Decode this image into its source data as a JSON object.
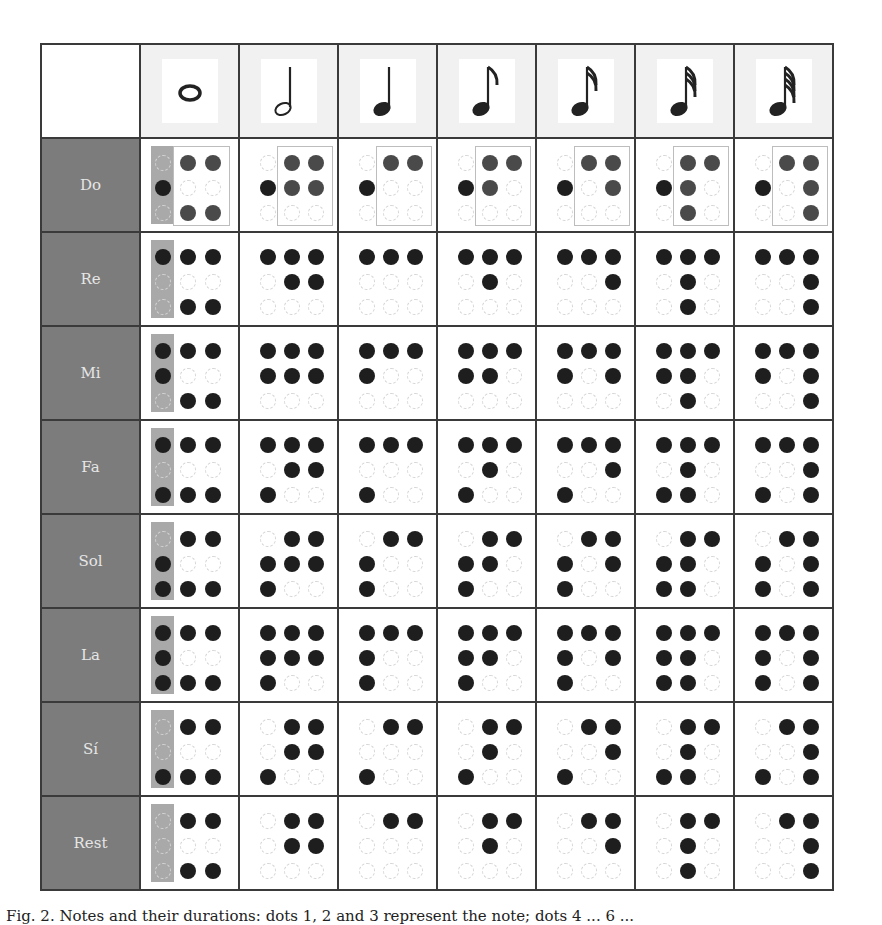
{
  "figure": {
    "caption": "Fig. 2.  Notes and their durations: dots 1, 2 and 3 represent the note; dots 4 ... 6 ...",
    "colors": {
      "row_label_bg": "#7c7c7c",
      "row_label_text": "#e6e6e6",
      "header_bg": "#f1f1f1",
      "grid_line": "#3a3a3a",
      "dot_filled": "#1e1e1e",
      "dot_empty": "#d4d4d4",
      "highlight_bar": "#a9a9a9"
    },
    "columns": [
      {
        "duration": "whole",
        "icon": "whole-note-icon",
        "glyph": "𝅝"
      },
      {
        "duration": "half",
        "icon": "half-note-icon",
        "glyph": "𝅗𝅥"
      },
      {
        "duration": "quarter",
        "icon": "quarter-note-icon",
        "glyph": "♩"
      },
      {
        "duration": "eighth",
        "icon": "eighth-note-icon",
        "glyph": "♪"
      },
      {
        "duration": "sixteenth",
        "icon": "sixteenth-note-icon",
        "glyph": "𝅘𝅥𝅯"
      },
      {
        "duration": "thirty-second",
        "icon": "thirty-second-note-icon",
        "glyph": "𝅘𝅥𝅰"
      },
      {
        "duration": "sixty-fourth",
        "icon": "sixty-fourth-note-icon",
        "glyph": "𝅘𝅥𝅱"
      }
    ],
    "rows": [
      {
        "label": "Do",
        "cells": [
          [
            [
              0,
              1,
              1
            ],
            [
              1,
              0,
              0
            ],
            [
              0,
              1,
              1
            ]
          ],
          [
            [
              0,
              1,
              1
            ],
            [
              1,
              1,
              1
            ],
            [
              0,
              0,
              0
            ]
          ],
          [
            [
              0,
              1,
              1
            ],
            [
              1,
              0,
              0
            ],
            [
              0,
              0,
              0
            ]
          ],
          [
            [
              0,
              1,
              1
            ],
            [
              1,
              1,
              0
            ],
            [
              0,
              0,
              0
            ]
          ],
          [
            [
              0,
              1,
              1
            ],
            [
              1,
              0,
              1
            ],
            [
              0,
              0,
              0
            ]
          ],
          [
            [
              0,
              1,
              1
            ],
            [
              1,
              1,
              0
            ],
            [
              0,
              1,
              0
            ]
          ],
          [
            [
              0,
              1,
              1
            ],
            [
              1,
              0,
              1
            ],
            [
              0,
              0,
              1
            ]
          ]
        ]
      },
      {
        "label": "Re",
        "cells": [
          [
            [
              1,
              1,
              1
            ],
            [
              0,
              0,
              0
            ],
            [
              0,
              1,
              1
            ]
          ],
          [
            [
              1,
              1,
              1
            ],
            [
              0,
              1,
              1
            ],
            [
              0,
              0,
              0
            ]
          ],
          [
            [
              1,
              1,
              1
            ],
            [
              0,
              0,
              0
            ],
            [
              0,
              0,
              0
            ]
          ],
          [
            [
              1,
              1,
              1
            ],
            [
              0,
              1,
              0
            ],
            [
              0,
              0,
              0
            ]
          ],
          [
            [
              1,
              1,
              1
            ],
            [
              0,
              0,
              1
            ],
            [
              0,
              0,
              0
            ]
          ],
          [
            [
              1,
              1,
              1
            ],
            [
              0,
              1,
              0
            ],
            [
              0,
              1,
              0
            ]
          ],
          [
            [
              1,
              1,
              1
            ],
            [
              0,
              0,
              1
            ],
            [
              0,
              0,
              1
            ]
          ]
        ]
      },
      {
        "label": "Mi",
        "cells": [
          [
            [
              1,
              1,
              1
            ],
            [
              1,
              0,
              0
            ],
            [
              0,
              1,
              1
            ]
          ],
          [
            [
              1,
              1,
              1
            ],
            [
              1,
              1,
              1
            ],
            [
              0,
              0,
              0
            ]
          ],
          [
            [
              1,
              1,
              1
            ],
            [
              1,
              0,
              0
            ],
            [
              0,
              0,
              0
            ]
          ],
          [
            [
              1,
              1,
              1
            ],
            [
              1,
              1,
              0
            ],
            [
              0,
              0,
              0
            ]
          ],
          [
            [
              1,
              1,
              1
            ],
            [
              1,
              0,
              1
            ],
            [
              0,
              0,
              0
            ]
          ],
          [
            [
              1,
              1,
              1
            ],
            [
              1,
              1,
              0
            ],
            [
              0,
              1,
              0
            ]
          ],
          [
            [
              1,
              1,
              1
            ],
            [
              1,
              0,
              1
            ],
            [
              0,
              0,
              1
            ]
          ]
        ]
      },
      {
        "label": "Fa",
        "cells": [
          [
            [
              1,
              1,
              1
            ],
            [
              0,
              0,
              0
            ],
            [
              1,
              1,
              1
            ]
          ],
          [
            [
              1,
              1,
              1
            ],
            [
              0,
              1,
              1
            ],
            [
              1,
              0,
              0
            ]
          ],
          [
            [
              1,
              1,
              1
            ],
            [
              0,
              0,
              0
            ],
            [
              1,
              0,
              0
            ]
          ],
          [
            [
              1,
              1,
              1
            ],
            [
              0,
              1,
              0
            ],
            [
              1,
              0,
              0
            ]
          ],
          [
            [
              1,
              1,
              1
            ],
            [
              0,
              0,
              1
            ],
            [
              1,
              0,
              0
            ]
          ],
          [
            [
              1,
              1,
              1
            ],
            [
              0,
              1,
              0
            ],
            [
              1,
              1,
              0
            ]
          ],
          [
            [
              1,
              1,
              1
            ],
            [
              0,
              0,
              1
            ],
            [
              1,
              0,
              1
            ]
          ]
        ]
      },
      {
        "label": "Sol",
        "cells": [
          [
            [
              0,
              1,
              1
            ],
            [
              1,
              0,
              0
            ],
            [
              1,
              1,
              1
            ]
          ],
          [
            [
              0,
              1,
              1
            ],
            [
              1,
              1,
              1
            ],
            [
              1,
              0,
              0
            ]
          ],
          [
            [
              0,
              1,
              1
            ],
            [
              1,
              0,
              0
            ],
            [
              1,
              0,
              0
            ]
          ],
          [
            [
              0,
              1,
              1
            ],
            [
              1,
              1,
              0
            ],
            [
              1,
              0,
              0
            ]
          ],
          [
            [
              0,
              1,
              1
            ],
            [
              1,
              0,
              1
            ],
            [
              1,
              0,
              0
            ]
          ],
          [
            [
              0,
              1,
              1
            ],
            [
              1,
              1,
              0
            ],
            [
              1,
              1,
              0
            ]
          ],
          [
            [
              0,
              1,
              1
            ],
            [
              1,
              0,
              1
            ],
            [
              1,
              0,
              1
            ]
          ]
        ]
      },
      {
        "label": "La",
        "cells": [
          [
            [
              1,
              1,
              1
            ],
            [
              1,
              0,
              0
            ],
            [
              1,
              1,
              1
            ]
          ],
          [
            [
              1,
              1,
              1
            ],
            [
              1,
              1,
              1
            ],
            [
              1,
              0,
              0
            ]
          ],
          [
            [
              1,
              1,
              1
            ],
            [
              1,
              0,
              0
            ],
            [
              1,
              0,
              0
            ]
          ],
          [
            [
              1,
              1,
              1
            ],
            [
              1,
              1,
              0
            ],
            [
              1,
              0,
              0
            ]
          ],
          [
            [
              1,
              1,
              1
            ],
            [
              1,
              0,
              1
            ],
            [
              1,
              0,
              0
            ]
          ],
          [
            [
              1,
              1,
              1
            ],
            [
              1,
              1,
              0
            ],
            [
              1,
              1,
              0
            ]
          ],
          [
            [
              1,
              1,
              1
            ],
            [
              1,
              0,
              1
            ],
            [
              1,
              0,
              1
            ]
          ]
        ]
      },
      {
        "label": "Sí",
        "cells": [
          [
            [
              0,
              1,
              1
            ],
            [
              0,
              0,
              0
            ],
            [
              1,
              1,
              1
            ]
          ],
          [
            [
              0,
              1,
              1
            ],
            [
              0,
              1,
              1
            ],
            [
              1,
              0,
              0
            ]
          ],
          [
            [
              0,
              1,
              1
            ],
            [
              0,
              0,
              0
            ],
            [
              1,
              0,
              0
            ]
          ],
          [
            [
              0,
              1,
              1
            ],
            [
              0,
              1,
              0
            ],
            [
              1,
              0,
              0
            ]
          ],
          [
            [
              0,
              1,
              1
            ],
            [
              0,
              0,
              1
            ],
            [
              1,
              0,
              0
            ]
          ],
          [
            [
              0,
              1,
              1
            ],
            [
              0,
              1,
              0
            ],
            [
              1,
              1,
              0
            ]
          ],
          [
            [
              0,
              1,
              1
            ],
            [
              0,
              0,
              1
            ],
            [
              1,
              0,
              1
            ]
          ]
        ]
      },
      {
        "label": "Rest",
        "cells": [
          [
            [
              0,
              1,
              1
            ],
            [
              0,
              0,
              0
            ],
            [
              0,
              1,
              1
            ]
          ],
          [
            [
              0,
              1,
              1
            ],
            [
              0,
              1,
              1
            ],
            [
              0,
              0,
              0
            ]
          ],
          [
            [
              0,
              1,
              1
            ],
            [
              0,
              0,
              0
            ],
            [
              0,
              0,
              0
            ]
          ],
          [
            [
              0,
              1,
              1
            ],
            [
              0,
              1,
              0
            ],
            [
              0,
              0,
              0
            ]
          ],
          [
            [
              0,
              1,
              1
            ],
            [
              0,
              0,
              1
            ],
            [
              0,
              0,
              0
            ]
          ],
          [
            [
              0,
              1,
              1
            ],
            [
              0,
              1,
              0
            ],
            [
              0,
              1,
              0
            ]
          ],
          [
            [
              0,
              1,
              1
            ],
            [
              0,
              0,
              1
            ],
            [
              0,
              0,
              1
            ]
          ]
        ]
      }
    ]
  }
}
